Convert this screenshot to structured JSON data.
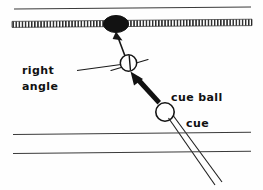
{
  "diagram": {
    "type": "billiards-shot-diagram",
    "labels": [
      {
        "id": "right-angle",
        "line1": "right",
        "line2": "angle",
        "x": 22,
        "y": 73
      },
      {
        "id": "cue-ball",
        "text": "cue ball",
        "x": 171,
        "y": 100
      },
      {
        "id": "cue",
        "text": "cue",
        "x": 186,
        "y": 126
      }
    ],
    "elements": {
      "object_ball": {
        "name": "object-ball",
        "fill": "#121212",
        "cx": 116,
        "cy": 24,
        "rx": 12,
        "ry": 8
      },
      "ghost_ball": {
        "name": "ghost-ball-contact-point",
        "fill": "#ffffff",
        "cx": 128,
        "cy": 63,
        "r": 8
      },
      "cue_ball": {
        "name": "cue-ball",
        "fill": "#ffffff",
        "cx": 165,
        "cy": 112,
        "r": 9
      },
      "cushion_band": {
        "name": "cushion-rail-hatched",
        "y": 23,
        "x1": 12,
        "x2": 252
      },
      "top_rail_line": {
        "name": "top-rail-line",
        "y": 8
      },
      "bottom_rail_lines": {
        "name": "bottom-rail-lines",
        "y1": 133,
        "y2": 152
      }
    },
    "colors": {
      "ink": "#121212",
      "line": "#3a3a3a",
      "paper": "#fefefe"
    }
  }
}
